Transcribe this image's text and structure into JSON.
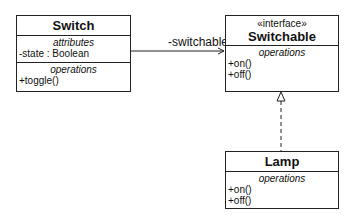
{
  "classes": {
    "switch": {
      "name": "Switch",
      "attributes_title": "attributes",
      "attributes": [
        "-state : Boolean"
      ],
      "operations_title": "operations",
      "operations": [
        "+toggle()"
      ]
    },
    "switchable": {
      "stereotype": "«interface»",
      "name": "Switchable",
      "operations_title": "operations",
      "operations": [
        "+on()",
        "+off()"
      ]
    },
    "lamp": {
      "name": "Lamp",
      "operations_title": "operations",
      "operations": [
        "+on()",
        "+off()"
      ]
    }
  },
  "relations": {
    "association_label": "-switchable",
    "realization": "Lamp implements Switchable"
  }
}
